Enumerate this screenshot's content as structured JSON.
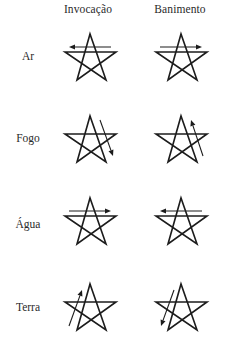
{
  "headers": {
    "invocation": "Invocação",
    "banishing": "Banimento"
  },
  "rows": [
    {
      "label": "Ar",
      "label_y": 50,
      "cell_top": 28,
      "invocation": {
        "arrow": "left"
      },
      "banishing": {
        "arrow": "right"
      }
    },
    {
      "label": "Fogo",
      "label_y": 132,
      "cell_top": 110,
      "invocation": {
        "arrow": "down-right"
      },
      "banishing": {
        "arrow": "up-right"
      }
    },
    {
      "label": "Água",
      "label_y": 218,
      "cell_top": 192,
      "invocation": {
        "arrow": "right"
      },
      "banishing": {
        "arrow": "left"
      }
    },
    {
      "label": "Terra",
      "label_y": 301,
      "cell_top": 278,
      "invocation": {
        "arrow": "up-left"
      },
      "banishing": {
        "arrow": "down-left"
      }
    }
  ],
  "columns": {
    "invocation_left": 55,
    "banishing_left": 146
  },
  "colors": {
    "ink": "#1c1c1c",
    "text": "#2a2a2a",
    "background": "#ffffff"
  }
}
